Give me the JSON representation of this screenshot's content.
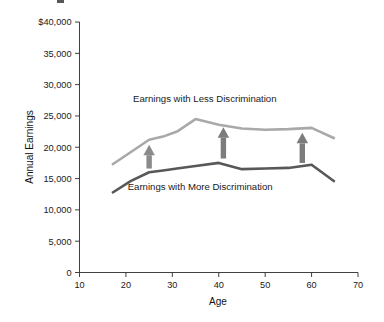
{
  "chart_data": {
    "type": "line",
    "title": "",
    "subtitle": "",
    "xlabel": "Age",
    "ylabel": "Annual Earnings",
    "xlim": [
      10,
      70
    ],
    "ylim": [
      0,
      40000
    ],
    "grid": false,
    "legend_position": "inline-annotations",
    "x_ticks": [
      10,
      20,
      30,
      40,
      50,
      60,
      70
    ],
    "x_tick_labels": [
      "10",
      "20",
      "30",
      "40",
      "50",
      "60",
      "70"
    ],
    "y_ticks": [
      0,
      5000,
      10000,
      15000,
      20000,
      25000,
      30000,
      35000,
      40000
    ],
    "y_tick_labels": [
      "0",
      "5,000",
      "10,000",
      "15,000",
      "20,000",
      "25,000",
      "30,000",
      "35,000",
      "$40,000"
    ],
    "series": [
      {
        "name": "Earnings with Less Discrimination",
        "color": "#a9a9a9",
        "stroke_width": 2.6,
        "x": [
          17,
          21,
          25,
          28,
          31,
          35,
          40,
          45,
          50,
          55,
          60,
          65
        ],
        "values": [
          17200,
          19200,
          21200,
          21700,
          22500,
          24500,
          23600,
          23000,
          22800,
          22900,
          23100,
          21400
        ]
      },
      {
        "name": "Earnings with More Discrimination",
        "color": "#585858",
        "stroke_width": 2.6,
        "x": [
          17,
          21,
          25,
          28,
          31,
          35,
          40,
          45,
          50,
          55,
          60,
          65
        ],
        "values": [
          12700,
          14600,
          16000,
          16300,
          16600,
          17000,
          17500,
          16500,
          16600,
          16700,
          17200,
          14500
        ]
      }
    ],
    "annotations": [
      {
        "type": "text",
        "text": "Earnings with Less Discrimination",
        "x": 37,
        "y": 27200
      },
      {
        "type": "text",
        "text": "Earnings with More Discrimination",
        "x": 36,
        "y": 13200
      },
      {
        "type": "arrow",
        "direction": "up",
        "x": 25,
        "y_from": 16600,
        "y_to": 20400,
        "color": "#8a8a8a"
      },
      {
        "type": "arrow",
        "direction": "up",
        "x": 41,
        "y_from": 18200,
        "y_to": 23200,
        "color": "#7c7c7c"
      },
      {
        "type": "arrow",
        "direction": "up",
        "x": 58,
        "y_from": 17500,
        "y_to": 22300,
        "color": "#7c7c7c"
      }
    ]
  },
  "axes": {
    "x_title": "Age",
    "y_title": "Annual Earnings"
  }
}
